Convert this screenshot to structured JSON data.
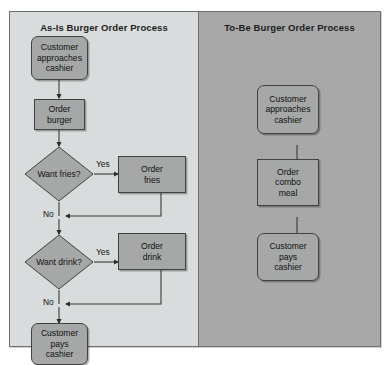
{
  "diagram": {
    "type": "flowchart-comparison",
    "panels": [
      {
        "id": "as-is",
        "title": "As-Is Burger Order Process",
        "nodes": [
          {
            "id": "as-is-start",
            "shape": "terminal",
            "label": "Customer\napproaches\ncashier"
          },
          {
            "id": "order-burger",
            "shape": "process",
            "label": "Order\nburger"
          },
          {
            "id": "want-fries",
            "shape": "decision",
            "label": "Want fries?"
          },
          {
            "id": "order-fries",
            "shape": "process",
            "label": "Order\nfries"
          },
          {
            "id": "want-drink",
            "shape": "decision",
            "label": "Want drink?"
          },
          {
            "id": "order-drink",
            "shape": "process",
            "label": "Order\ndrink"
          },
          {
            "id": "as-is-end",
            "shape": "terminal",
            "label": "Customer\npays\ncashier"
          }
        ],
        "edge_labels": [
          {
            "id": "fries-yes",
            "text": "Yes"
          },
          {
            "id": "fries-no",
            "text": "No"
          },
          {
            "id": "drink-yes",
            "text": "Yes"
          },
          {
            "id": "drink-no",
            "text": "No"
          }
        ]
      },
      {
        "id": "to-be",
        "title": "To-Be Burger Order Process",
        "nodes": [
          {
            "id": "to-be-start",
            "shape": "terminal",
            "label": "Customer\napproaches\ncashier"
          },
          {
            "id": "order-combo",
            "shape": "process",
            "label": "Order\ncombo\nmeal"
          },
          {
            "id": "to-be-end",
            "shape": "terminal",
            "label": "Customer\npays\ncashier"
          }
        ],
        "edge_labels": []
      }
    ]
  },
  "colors": {
    "page_background": "#ffffff",
    "frame_border": "#6f6f6f",
    "as_is_background": "#d9dcdc",
    "to_be_background": "#a8a8a8",
    "as_is_node_fill": "#a6a8a8",
    "to_be_node_fill": "#8d8f8f",
    "node_border": "#414141",
    "connector": "#3a3a3a",
    "text": "#101010"
  }
}
